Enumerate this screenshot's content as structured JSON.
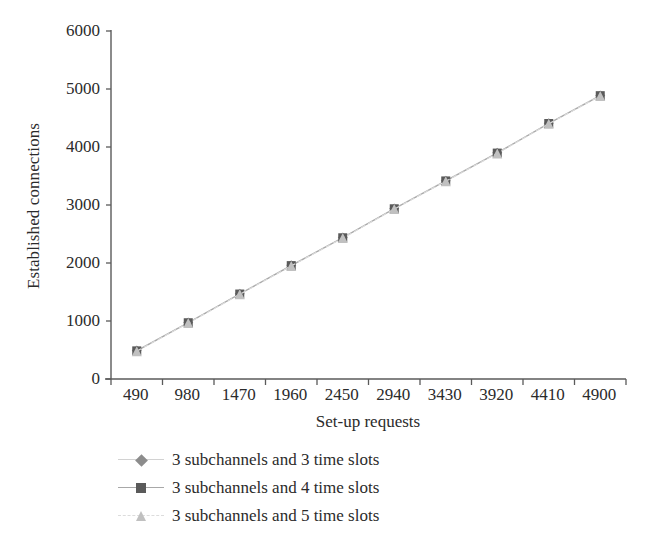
{
  "chart_data": {
    "type": "line",
    "title": "",
    "xlabel": "Set-up requests",
    "ylabel": "Established connections",
    "categories": [
      "490",
      "980",
      "1470",
      "1960",
      "2450",
      "2940",
      "3430",
      "3920",
      "4410",
      "4900"
    ],
    "xtick_labels": [
      "490",
      "980",
      "1470",
      "1960",
      "2450",
      "2940",
      "3430",
      "3920",
      "4410",
      "4900"
    ],
    "ytick_labels": [
      "0",
      "1000",
      "2000",
      "3000",
      "4000",
      "5000",
      "6000"
    ],
    "ylim": [
      0,
      6000
    ],
    "ytick_values": [
      0,
      1000,
      2000,
      3000,
      4000,
      5000,
      6000
    ],
    "grid": false,
    "legend_position": "below-left",
    "series": [
      {
        "name": "3 subchannels and 3 time slots",
        "marker": "diamond",
        "marker_color": "#8c8c8c",
        "line_color": "#d2d2d2",
        "line_style": "solid",
        "values": [
          490,
          975,
          1470,
          1960,
          2440,
          2940,
          3420,
          3900,
          4410,
          4890
        ]
      },
      {
        "name": "3 subchannels and 4 time slots",
        "marker": "square",
        "marker_color": "#5a5a5a",
        "line_color": "#a8a8a8",
        "line_style": "solid",
        "values": [
          485,
          970,
          1465,
          1955,
          2435,
          2935,
          3415,
          3895,
          4405,
          4885
        ]
      },
      {
        "name": "3 subchannels and 5 time slots",
        "marker": "triangle",
        "marker_color": "#c0c0c0",
        "line_color": "#dcdcdc",
        "line_style": "dashed",
        "values": [
          480,
          965,
          1460,
          1950,
          2430,
          2930,
          3410,
          3890,
          4400,
          4880
        ]
      }
    ]
  },
  "axis": {
    "line_color": "#5a5a5a",
    "tick_color": "#5a5a5a"
  },
  "legend": {
    "items": [
      {
        "label": "3 subchannels and 3 time slots"
      },
      {
        "label": "3 subchannels and 4 time slots"
      },
      {
        "label": "3 subchannels and 5 time slots"
      }
    ]
  }
}
